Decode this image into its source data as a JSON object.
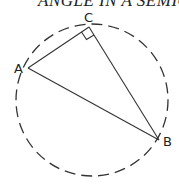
{
  "title": "ANGLE IN A SEMICIRCLE",
  "diagram": {
    "points": [
      {
        "name": "A",
        "label": "A"
      },
      {
        "name": "B",
        "label": "B"
      },
      {
        "name": "C",
        "label": "C"
      }
    ],
    "segments": [
      "AC",
      "CB",
      "AB"
    ],
    "right_angle_at": "C",
    "circle_style": "dashed"
  }
}
